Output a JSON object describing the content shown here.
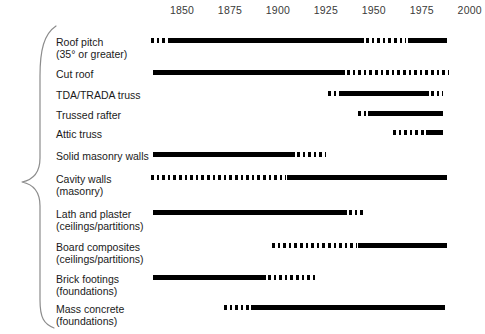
{
  "chart_data": {
    "type": "bar",
    "title": "",
    "subtitle": "",
    "xlabel": "",
    "ylabel": "",
    "xlim": [
      1835,
      2010
    ],
    "grid": false,
    "legend": null,
    "orientation": "horizontal",
    "style": "timeline-gantt",
    "axis_ticks": [
      {
        "label": "1850",
        "value": 1850
      },
      {
        "label": "1875",
        "value": 1875
      },
      {
        "label": "1900",
        "value": 1900
      },
      {
        "label": "1925",
        "value": 1925
      },
      {
        "label": "1950",
        "value": 1950
      },
      {
        "label": "1975",
        "value": 1975
      },
      {
        "label": "2000",
        "value": 2000
      }
    ],
    "categories": [
      "Roof pitch (35° or greater)",
      "Cut roof",
      "TDA/TRADA truss",
      "Trussed rafter",
      "Attic truss",
      "Solid masonry walls",
      "Cavity walls (masonry)",
      "Lath and plaster (ceilings/partitions)",
      "Board composites (ceilings/partitions)",
      "Brick footings (foundations)",
      "Mass concrete (foundations)"
    ],
    "rows": [
      {
        "label_line1": "Roof pitch",
        "label_line2": "(35° or greater)",
        "group": "roofs",
        "segments": [
          {
            "style": "dotted",
            "start": 1834,
            "end": 1844
          },
          {
            "style": "solid",
            "start": 1844,
            "end": 1945
          },
          {
            "style": "dotted",
            "start": 1946,
            "end": 1967
          },
          {
            "style": "solid",
            "start": 1968,
            "end": 1988
          }
        ]
      },
      {
        "label_line1": "Cut roof",
        "label_line2": "",
        "group": "roofs",
        "segments": [
          {
            "style": "solid",
            "start": 1835,
            "end": 1935
          },
          {
            "style": "dotted",
            "start": 1936,
            "end": 1989
          }
        ]
      },
      {
        "label_line1": "TDA/TRADA truss",
        "label_line2": "",
        "group": "roofs",
        "segments": [
          {
            "style": "dotted",
            "start": 1926,
            "end": 1931
          },
          {
            "style": "solid",
            "start": 1932,
            "end": 1979
          },
          {
            "style": "dotted",
            "start": 1980,
            "end": 1986
          }
        ]
      },
      {
        "label_line1": "Trussed rafter",
        "label_line2": "",
        "group": "roofs",
        "segments": [
          {
            "style": "dotted",
            "start": 1942,
            "end": 1946
          },
          {
            "style": "solid",
            "start": 1947,
            "end": 1986
          }
        ]
      },
      {
        "label_line1": "Attic truss",
        "label_line2": "",
        "group": "roofs",
        "segments": [
          {
            "style": "dotted",
            "start": 1960,
            "end": 1976
          },
          {
            "style": "solid",
            "start": 1977,
            "end": 1986
          }
        ]
      },
      {
        "label_line1": "Solid masonry walls",
        "label_line2": "",
        "group": "walls",
        "segments": [
          {
            "style": "solid",
            "start": 1835,
            "end": 1909
          },
          {
            "style": "dotted",
            "start": 1910,
            "end": 1925
          }
        ]
      },
      {
        "label_line1": "Cavity walls",
        "label_line2": "(masonry)",
        "group": "walls",
        "segments": [
          {
            "style": "dotted",
            "start": 1834,
            "end": 1904
          },
          {
            "style": "solid",
            "start": 1905,
            "end": 1988
          }
        ]
      },
      {
        "label_line1": "Lath and plaster",
        "label_line2": "(ceilings/partitions)",
        "group": "internal",
        "segments": [
          {
            "style": "solid",
            "start": 1835,
            "end": 1936
          },
          {
            "style": "dotted",
            "start": 1937,
            "end": 1945
          }
        ]
      },
      {
        "label_line1": "Board composites",
        "label_line2": "(ceilings/partitions)",
        "group": "internal",
        "segments": [
          {
            "style": "dotted",
            "start": 1897,
            "end": 1941
          },
          {
            "style": "solid",
            "start": 1942,
            "end": 1988
          }
        ]
      },
      {
        "label_line1": "Brick footings",
        "label_line2": "(foundations)",
        "group": "foundations",
        "segments": [
          {
            "style": "solid",
            "start": 1835,
            "end": 1894
          },
          {
            "style": "dotted",
            "start": 1895,
            "end": 1920
          }
        ]
      },
      {
        "label_line1": "Mass concrete",
        "label_line2": "(foundations)",
        "group": "foundations",
        "segments": [
          {
            "style": "dotted",
            "start": 1872,
            "end": 1885
          },
          {
            "style": "solid",
            "start": 1886,
            "end": 1987
          }
        ]
      }
    ]
  }
}
